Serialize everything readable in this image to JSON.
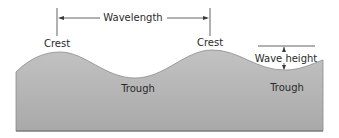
{
  "diagram": {
    "labels": {
      "wavelength": "Wavelength",
      "crest_left": "Crest",
      "crest_right": "Crest",
      "trough_left": "Trough",
      "trough_right": "Trough",
      "wave_height": "Wave height"
    },
    "colors": {
      "wave_fill": "#b4b4b4",
      "wave_edge": "#8c8c8c",
      "line": "#3a3a3a",
      "text": "#2a2a2a"
    }
  }
}
